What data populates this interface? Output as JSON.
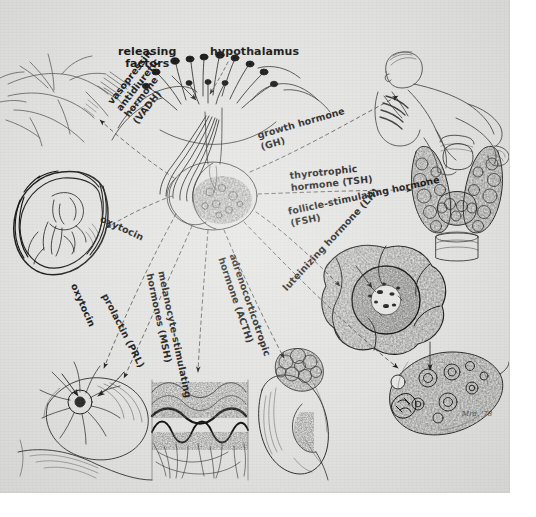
{
  "figure": {
    "medium": "pen-and-ink anatomical illustration",
    "background_color": "#e3e3e1",
    "ink_color": "#1a1a1a",
    "signature": "Mrd. '78"
  },
  "center_labels": {
    "releasing_factors": "releasing\nfactors",
    "hypothalamus": "hypothalamus"
  },
  "hormones": [
    {
      "id": "vadh",
      "label": "vasopressin\nantidiuretic\nhormone\n(VADH)",
      "abbr": "VADH",
      "target": "kidney-nephron-vasculature",
      "lobe": "posterior"
    },
    {
      "id": "oxytocin-uterus",
      "label": "oxytocin",
      "abbr": "",
      "target": "uterus-with-fetus",
      "lobe": "posterior"
    },
    {
      "id": "oxytocin-breast",
      "label": "oxytocin",
      "abbr": "",
      "target": "mammary-gland",
      "lobe": "posterior"
    },
    {
      "id": "prl",
      "label": "prolactin (PRL)",
      "abbr": "PRL",
      "target": "mammary-gland",
      "lobe": "anterior"
    },
    {
      "id": "msh",
      "label": "melanocyte-stimulating\nhormones (MSH)",
      "abbr": "MSH",
      "target": "skin-cross-section",
      "lobe": "intermediate"
    },
    {
      "id": "acth",
      "label": "adrenocorticotropic\nhormone (ACTH)",
      "abbr": "ACTH",
      "target": "adrenal-gland-on-kidney",
      "lobe": "anterior"
    },
    {
      "id": "lh",
      "label": "luteinizing hormone (LH)",
      "abbr": "LH",
      "target": "ovary-corpus-luteum",
      "lobe": "anterior"
    },
    {
      "id": "fsh",
      "label": "follicle-stimulating hormone\n(FSH)",
      "abbr": "FSH",
      "target": "ovarian-follicle",
      "lobe": "anterior"
    },
    {
      "id": "tsh",
      "label": "thyrotrophic\nhormone (TSH)",
      "abbr": "TSH",
      "target": "thyroid-gland",
      "lobe": "anterior"
    },
    {
      "id": "gh",
      "label": "growth hormone\n(GH)",
      "abbr": "GH",
      "target": "infant-crawling",
      "lobe": "anterior"
    }
  ],
  "organs": [
    {
      "id": "kidney-vessels",
      "name": "renal vasculature / nephron"
    },
    {
      "id": "uterus-fetus",
      "name": "gravid uterus with fetus"
    },
    {
      "id": "breast",
      "name": "mammary gland"
    },
    {
      "id": "skin",
      "name": "skin cross-section"
    },
    {
      "id": "adrenal-kidney",
      "name": "adrenal gland on kidney"
    },
    {
      "id": "follicle",
      "name": "ovarian follicle cross-section"
    },
    {
      "id": "ovary",
      "name": "ovary with follicles"
    },
    {
      "id": "thyroid",
      "name": "thyroid gland"
    },
    {
      "id": "infant",
      "name": "crawling infant"
    },
    {
      "id": "pituitary",
      "name": "hypothalamus and pituitary gland"
    }
  ]
}
